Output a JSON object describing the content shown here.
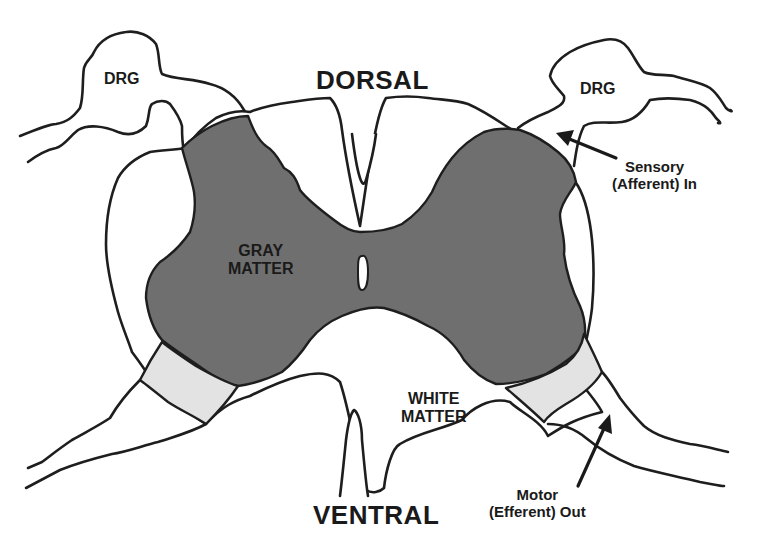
{
  "diagram": {
    "orientation": {
      "top": "DORSAL",
      "bottom": "VENTRAL"
    },
    "regions": {
      "gray_matter": {
        "line1": "GRAY",
        "line2": "MATTER"
      },
      "white_matter": {
        "line1": "WHITE",
        "line2": "MATTER"
      }
    },
    "ganglia": {
      "left": "DRG",
      "right": "DRG"
    },
    "annotations": {
      "sensory": {
        "line1": "Sensory",
        "line2": "(Afferent) In"
      },
      "motor": {
        "line1": "Motor",
        "line2": "(Efferent) Out"
      }
    },
    "colors": {
      "gray_matter": "#6f6f6f",
      "root_zone": "#e3e3e3",
      "outline": "#1e1e1e",
      "background": "#ffffff"
    }
  }
}
